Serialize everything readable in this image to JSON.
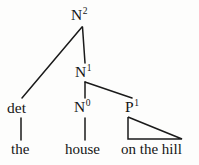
{
  "figure": {
    "name": "syntax-tree",
    "type": "phrase-structure-tree",
    "background_color": "#fdfdfc",
    "line_color": "#1a1a1a",
    "text_color": "#151515"
  },
  "nodes": {
    "root": {
      "base": "N",
      "superscript": "2",
      "full": "N2"
    },
    "nbar": {
      "base": "N",
      "superscript": "1",
      "full": "N1"
    },
    "nzero": {
      "base": "N",
      "superscript": "0",
      "full": "N0"
    },
    "pbar": {
      "base": "P",
      "superscript": "1",
      "full": "P1"
    },
    "det": {
      "base": "det",
      "superscript": "",
      "full": "det"
    }
  },
  "terminals": {
    "the": "the",
    "house": "house",
    "on_the_hill": "on the hill"
  },
  "edges": [
    {
      "name": "root-to-det",
      "from": "N2",
      "to": "det"
    },
    {
      "name": "root-to-nbar",
      "from": "N2",
      "to": "N1"
    },
    {
      "name": "nbar-to-nzero",
      "from": "N1",
      "to": "N0"
    },
    {
      "name": "nbar-to-pbar",
      "from": "N1",
      "to": "P1"
    },
    {
      "name": "det-to-the",
      "from": "det",
      "to": "the"
    },
    {
      "name": "nzero-to-house",
      "from": "N0",
      "to": "house"
    },
    {
      "name": "pbar-triangle",
      "from": "P1",
      "to": "on the hill"
    }
  ]
}
